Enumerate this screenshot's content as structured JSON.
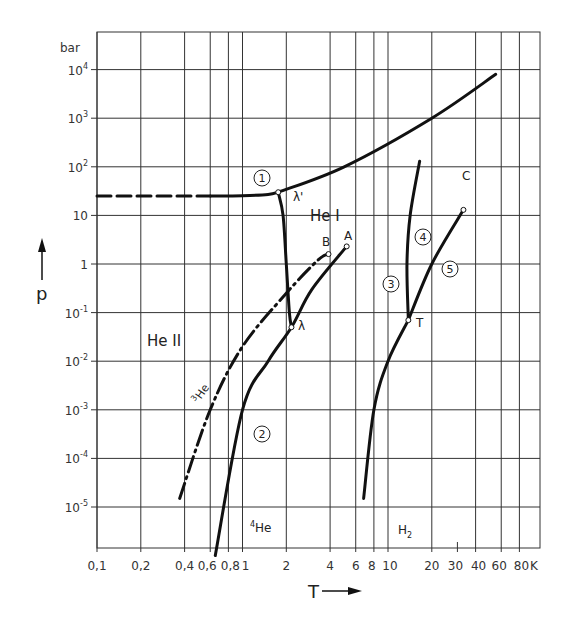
{
  "chart_data": {
    "type": "line",
    "title": "",
    "xlabel": "T",
    "ylabel": "p",
    "x_unit": "K",
    "y_unit": "bar",
    "x_scale": "log",
    "y_scale": "log",
    "xlim": [
      0.1,
      100
    ],
    "ylim": [
      1e-06,
      30000.0
    ],
    "grid": true,
    "x_ticks": [
      {
        "v": 0.1,
        "label": "0,1"
      },
      {
        "v": 0.2,
        "label": "0,2"
      },
      {
        "v": 0.4,
        "label": "0,4"
      },
      {
        "v": 0.6,
        "label": "0,6"
      },
      {
        "v": 0.8,
        "label": "0,8"
      },
      {
        "v": 1,
        "label": "1"
      },
      {
        "v": 2,
        "label": "2"
      },
      {
        "v": 4,
        "label": "4"
      },
      {
        "v": 6,
        "label": "6"
      },
      {
        "v": 8,
        "label": "8"
      },
      {
        "v": 10,
        "label": "10"
      },
      {
        "v": 20,
        "label": "20"
      },
      {
        "v": 30,
        "label": "30"
      },
      {
        "v": 40,
        "label": "40"
      },
      {
        "v": 60,
        "label": "60"
      },
      {
        "v": 80,
        "label": "80"
      }
    ],
    "y_ticks": [
      {
        "v": 10000.0,
        "base": "10",
        "exp": "4"
      },
      {
        "v": 1000.0,
        "base": "10",
        "exp": "3"
      },
      {
        "v": 100.0,
        "base": "10",
        "exp": "2"
      },
      {
        "v": 10,
        "base": "10",
        "exp": ""
      },
      {
        "v": 1,
        "base": "1",
        "exp": ""
      },
      {
        "v": 0.1,
        "base": "10",
        "exp": "-1"
      },
      {
        "v": 0.01,
        "base": "10",
        "exp": "-2"
      },
      {
        "v": 0.001,
        "base": "10",
        "exp": "-3"
      },
      {
        "v": 0.0001,
        "base": "10",
        "exp": "-4"
      },
      {
        "v": 1e-05,
        "base": "10",
        "exp": "-5"
      }
    ],
    "series": [
      {
        "name": "1 melting curve 4He (dashed extrapolation)",
        "style": "dashed",
        "points": [
          [
            0.1,
            25
          ],
          [
            0.6,
            25
          ]
        ]
      },
      {
        "name": "1 melting curve 4He",
        "style": "solid",
        "points": [
          [
            0.6,
            25
          ],
          [
            1.0,
            25.5
          ],
          [
            1.5,
            27
          ],
          [
            1.76,
            30
          ]
        ]
      },
      {
        "name": "1 melting curve 4He (high pressure)",
        "style": "solid",
        "points": [
          [
            1.76,
            30
          ],
          [
            5,
            100
          ],
          [
            20,
            1000
          ],
          [
            55,
            8000
          ]
        ]
      },
      {
        "name": "lambda line",
        "style": "solid",
        "points": [
          [
            1.76,
            30
          ],
          [
            1.9,
            10
          ],
          [
            2.0,
            1
          ],
          [
            2.1,
            0.1
          ],
          [
            2.17,
            0.05
          ]
        ]
      },
      {
        "name": "2 vapor pressure 4He",
        "style": "solid",
        "points": [
          [
            0.65,
            1e-06
          ],
          [
            1.0,
            0.001
          ],
          [
            1.5,
            0.01
          ],
          [
            2.17,
            0.05
          ],
          [
            3,
            0.3
          ],
          [
            5.2,
            2.3
          ]
        ]
      },
      {
        "name": "3He vapor pressure",
        "style": "dash-dot",
        "points": [
          [
            0.37,
            1.5e-05
          ],
          [
            0.6,
            0.001
          ],
          [
            1.0,
            0.02
          ],
          [
            2,
            0.25
          ],
          [
            3.3,
            1.2
          ],
          [
            3.9,
            1.6
          ]
        ]
      },
      {
        "name": "3 vapor/sublimation H2",
        "style": "solid",
        "points": [
          [
            6.8,
            1.5e-05
          ],
          [
            8,
            0.001
          ],
          [
            10,
            0.01
          ],
          [
            13.8,
            0.07
          ]
        ]
      },
      {
        "name": "4 melting curve H2",
        "style": "solid",
        "points": [
          [
            13.8,
            0.07
          ],
          [
            13.5,
            1
          ],
          [
            14.2,
            10
          ],
          [
            16.5,
            130
          ]
        ]
      },
      {
        "name": "5 vapor pressure H2",
        "style": "solid",
        "points": [
          [
            13.8,
            0.07
          ],
          [
            20,
            1
          ],
          [
            33,
            13
          ]
        ]
      }
    ],
    "points": [
      {
        "label": "λ'",
        "T": 1.76,
        "p": 30
      },
      {
        "label": "λ",
        "T": 2.17,
        "p": 0.05
      },
      {
        "label": "A",
        "T": 5.2,
        "p": 2.3
      },
      {
        "label": "B",
        "T": 3.9,
        "p": 1.6
      },
      {
        "label": "C",
        "T": 33,
        "p": 13
      },
      {
        "label": "T",
        "T": 13.8,
        "p": 0.07
      }
    ],
    "annotations": [
      {
        "text": "①",
        "T": 1.5,
        "p": 80
      },
      {
        "text": "②",
        "T": 1.5,
        "p": 0.0003
      },
      {
        "text": "③",
        "T": 8.5,
        "p": 0.5
      },
      {
        "text": "④",
        "T": 13,
        "p": 3
      },
      {
        "text": "⑤",
        "T": 24,
        "p": 0.8
      },
      {
        "text": "He I",
        "T": 2.8,
        "p": 10
      },
      {
        "text": "He II",
        "T": 0.45,
        "p": 0.02
      },
      {
        "text": "3He",
        "T": 0.5,
        "p": 0.001
      },
      {
        "text": "4He",
        "T": 1.4,
        "p": 3e-06
      },
      {
        "text": "H2",
        "T": 10.5,
        "p": 3e-06
      }
    ]
  },
  "labels": {
    "y_unit": "bar",
    "x_unit": "K",
    "y_axis": "p",
    "x_axis": "T",
    "he1": "He I",
    "he2": "He II",
    "lambda_prime": "λ'",
    "lambda": "λ",
    "A": "A",
    "B": "B",
    "C": "C",
    "T": "T",
    "he3": "He",
    "he3_sup": "3",
    "he4": "He",
    "he4_sup": "4",
    "h2": "H",
    "h2_sub": "2",
    "c1": "1",
    "c2": "2",
    "c3": "3",
    "c4": "4",
    "c5": "5"
  }
}
